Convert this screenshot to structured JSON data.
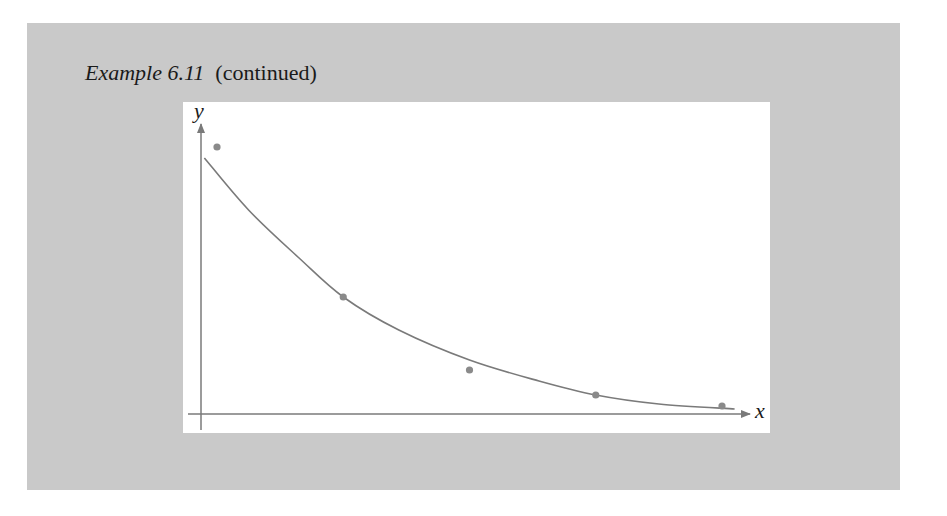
{
  "caption": {
    "example_label": "Example 6.11",
    "suffix": "(continued)"
  },
  "axes": {
    "x_label": "x",
    "y_label": "y"
  },
  "colors": {
    "panel_background": "#c9c9c9",
    "plot_background": "#ffffff",
    "curve": "#7a7a7a",
    "points": "#8a8a8a",
    "axes": "#7a7a7a"
  },
  "chart_data": {
    "type": "scatter",
    "title": "Example 6.11 (continued)",
    "xlabel": "x",
    "ylabel": "y",
    "note": "No tick labels are shown. The values below are relative positions estimated from the pixels, not measured data.",
    "units": "relative (y as height above x-axis in pixels)",
    "grid": false,
    "legend": null,
    "series": [
      {
        "name": "data points",
        "kind": "scatter",
        "x": [
          1,
          2,
          3,
          4,
          5
        ],
        "y": [
          267,
          117,
          44,
          19,
          8
        ]
      },
      {
        "name": "fitted curve",
        "kind": "line",
        "shape": "decaying exponential",
        "x": [
          0.9,
          1.25,
          1.65,
          2,
          2.44,
          3,
          3.55,
          4,
          4.5,
          5.1
        ],
        "y": [
          256,
          204,
          156,
          117,
          84,
          54,
          33,
          19,
          10,
          5
        ]
      }
    ]
  }
}
